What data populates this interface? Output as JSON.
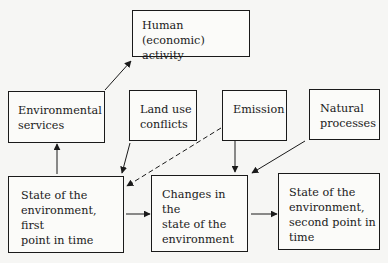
{
  "diagram": {
    "nodes": {
      "human": "Human (economic)\nactivity",
      "env_services": "Environmental\nservices",
      "land_use": "Land use\nconflicts",
      "emission": "Emission",
      "natural": "Natural\nprocesses",
      "state_first": "State of the\nenvironment, first\npoint in time",
      "changes": "Changes in the\nstate of the\nenvironment",
      "state_second": "State of the\nenvironment,\nsecond point in\ntime"
    },
    "edges": [
      {
        "from": "env_services",
        "to": "human",
        "style": "solid"
      },
      {
        "from": "state_first",
        "to": "env_services",
        "style": "solid"
      },
      {
        "from": "land_use",
        "to": "state_first",
        "style": "solid"
      },
      {
        "from": "emission",
        "to": "state_first",
        "style": "dashed"
      },
      {
        "from": "emission",
        "to": "changes",
        "style": "solid"
      },
      {
        "from": "natural",
        "to": "changes",
        "style": "solid"
      },
      {
        "from": "state_first",
        "to": "changes",
        "style": "solid"
      },
      {
        "from": "changes",
        "to": "state_second",
        "style": "solid"
      }
    ]
  }
}
